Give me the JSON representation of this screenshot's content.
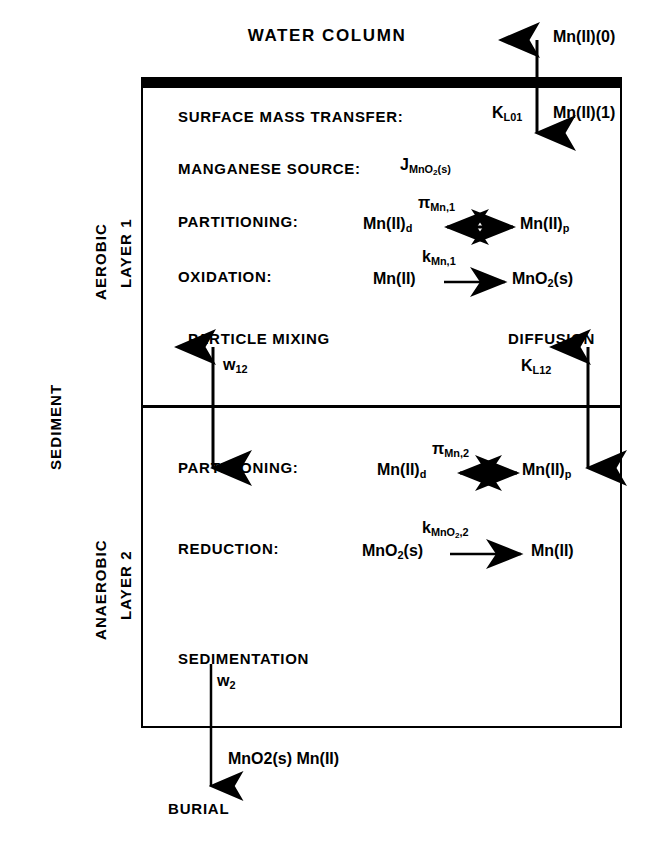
{
  "diagram": {
    "title": "WATER COLUMN",
    "burial_label": "BURIAL",
    "side_labels": {
      "aerobic": "AEROBIC",
      "layer1": "LAYER 1",
      "sediment": "SEDIMENT",
      "anaerobic": "ANAEROBIC",
      "layer2": "LAYER 2"
    },
    "layer1": {
      "rows": [
        {
          "label": "SURFACE MASS TRANSFER:",
          "coefficient": "K_L01"
        },
        {
          "label": "MANGANESE SOURCE:",
          "coefficient": "J_MnO2(s)"
        },
        {
          "label": "PARTITIONING:",
          "coefficient": "pi_Mn,1",
          "left": "Mn(II)d",
          "right": "Mn(II)p",
          "arrow": "double"
        },
        {
          "label": "OXIDATION:",
          "coefficient": "k_Mn,1",
          "left": "Mn(II)",
          "right": "MnO2(s)",
          "arrow": "single"
        }
      ],
      "particle_mixing_label": "PARTICLE MIXING",
      "particle_mixing_coefficient": "w12",
      "diffusion_label": "DIFFUSION",
      "diffusion_coefficient": "K_L12"
    },
    "layer2": {
      "rows": [
        {
          "label": "PARTITIONING:",
          "coefficient": "pi_Mn,2",
          "left": "Mn(II)d",
          "right": "Mn(II)p",
          "arrow": "double"
        },
        {
          "label": "REDUCTION:",
          "coefficient": "k_MnO2,2",
          "left": "MnO2(s)",
          "right": "Mn(II)",
          "arrow": "single"
        }
      ],
      "sedimentation_label": "SEDIMENTATION",
      "sedimentation_coefficient": "w2"
    },
    "fluxes": {
      "water_to_sediment_out": "Mn(II)(0)",
      "water_to_sediment_in": "Mn(II)(1)",
      "burial_species": "MnO2(s)  Mn(II)"
    },
    "colors": {
      "line": "#000000",
      "background": "#ffffff"
    }
  }
}
